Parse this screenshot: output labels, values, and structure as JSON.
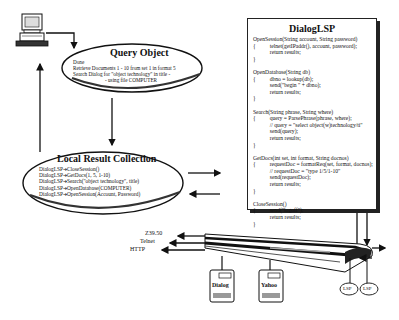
{
  "query_object": {
    "title": "Query Object",
    "lines": [
      "Done",
      "Retrieve Documents 1 - 10 from set 1 in format 5",
      "Search Dialog for \"object technology\" in title -",
      "- using file COMPUTER"
    ]
  },
  "local_result_collection": {
    "title": "Local Result Collection",
    "lines": [
      "DialogLSP➔CloseSession()",
      "DialogLSP➔GetDocs(1, 5, 1-10)",
      "DialogLSP➔Search(\"object technology\", title)",
      "DialogLSP➔OpenDatabase(COMPUTER)",
      "DialogLSP➔OpenSession(Account, Password)"
    ]
  },
  "dialog_lsp": {
    "title": "DialogLSP",
    "code": [
      "OpenSession(String account, String password)",
      "{          telnet(getIPaddr(), account, password);",
      "            return results;",
      "}",
      "",
      "OpenDatabase(String db)",
      "{          dbno = lookup(db);",
      "            send(\"begin \" + dbno);",
      "            return results;",
      "}",
      "",
      "Search(String phrase, String where)",
      "{          query = ParsePhrase(phrase, where);",
      "            // query = \"select object(w)technology/ti\"",
      "            send(query);",
      "            return results;",
      "}",
      "",
      "GetDocs(int set, int format, String docnos)",
      "{          requestDoc = formatReq(set, format, docnos);",
      "            // requestDoc = \"type 1/5/1-10\"",
      "            send(requestDoc);",
      "            return results;",
      "}",
      "",
      "CloseSession()",
      "{          send(\"logoff\");",
      "            return results;",
      "}"
    ]
  },
  "protocols": [
    "Z39.50",
    "Telnet",
    "HTTP"
  ],
  "servers": [
    "Dialog",
    "Yahoo"
  ],
  "lsp_labels": [
    "LSP",
    "LSP"
  ]
}
